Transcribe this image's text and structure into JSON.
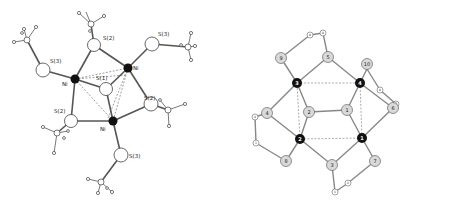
{
  "left_diagram": {
    "title": "Ni3 cluster with S ligands (ball-and-stick)",
    "labels": {
      "ni_a": "Ni",
      "ni_b": "Ni",
      "ni_c": "Ni",
      "s1": "S(1)",
      "s2_top": "S(2)",
      "s2_right": "S(2)",
      "s2_left": "S(2)",
      "s3_left": "S(3)",
      "s3_right": "S(3)",
      "s3_bottom": "S(3)"
    },
    "colors": {
      "metal": "#111111",
      "atom_fill": "#ffffff",
      "bond": "#555555",
      "dashed": "#777777"
    }
  },
  "right_diagram": {
    "title": "Schematic numbered atom framework",
    "metal_labels": [
      "1",
      "2",
      "3",
      "4"
    ],
    "ligand_labels": [
      "1",
      "2",
      "3",
      "4",
      "5",
      "6",
      "7",
      "8",
      "9",
      "10"
    ],
    "small_labels": [
      "8",
      "8",
      "8",
      "7",
      "4",
      "1",
      "2",
      "1"
    ],
    "colors": {
      "metal": "#111111",
      "ligand_fill": "#d9d9d9",
      "small_fill": "#ffffff",
      "bond": "#888888",
      "dashed": "#888888"
    }
  }
}
